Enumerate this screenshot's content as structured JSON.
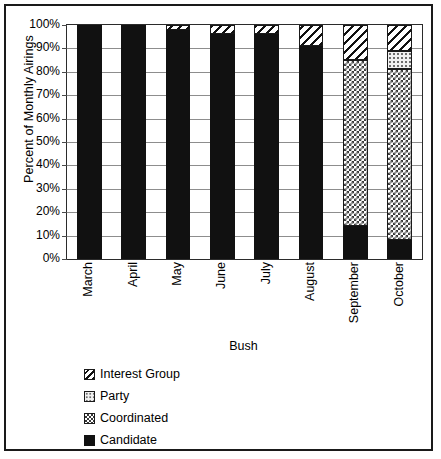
{
  "chart_data": {
    "type": "bar",
    "subtype": "stacked-percent-column",
    "title": "",
    "xlabel": "Bush",
    "ylabel": "Percent of Monthly Airings",
    "ylim": [
      0,
      100
    ],
    "ytick_labels": [
      "100%",
      "90%",
      "80%",
      "70%",
      "60%",
      "50%",
      "40%",
      "30%",
      "20%",
      "10%",
      "0%"
    ],
    "ytick_values": [
      100,
      90,
      80,
      70,
      60,
      50,
      40,
      30,
      20,
      10,
      0
    ],
    "grid": true,
    "legend_position": "below-plot-left",
    "categories": [
      "March",
      "April",
      "May",
      "June",
      "July",
      "August",
      "September",
      "October"
    ],
    "series": [
      {
        "name": "Candidate",
        "pattern": "solid-black",
        "color": "#111111",
        "values": [
          100,
          100,
          98,
          96,
          96,
          91,
          14,
          8
        ]
      },
      {
        "name": "Coordinated",
        "pattern": "checkerboard",
        "color": "#3a3a3a",
        "values": [
          0,
          0,
          0,
          0,
          0,
          0,
          71,
          73
        ]
      },
      {
        "name": "Party",
        "pattern": "light-dots",
        "color": "#6e6e6e",
        "values": [
          0,
          0,
          0,
          0,
          0,
          0,
          0,
          8
        ]
      },
      {
        "name": "Interest Group",
        "pattern": "diagonal-hatch",
        "color": "#111111",
        "values": [
          0,
          0,
          2,
          4,
          4,
          9,
          15,
          11
        ]
      }
    ],
    "legend_entries": [
      {
        "label": "Interest Group",
        "pattern": "diagonal-hatch"
      },
      {
        "label": "Party",
        "pattern": "light-dots"
      },
      {
        "label": "Coordinated",
        "pattern": "checkerboard"
      },
      {
        "label": "Candidate",
        "pattern": "solid-black"
      }
    ]
  }
}
